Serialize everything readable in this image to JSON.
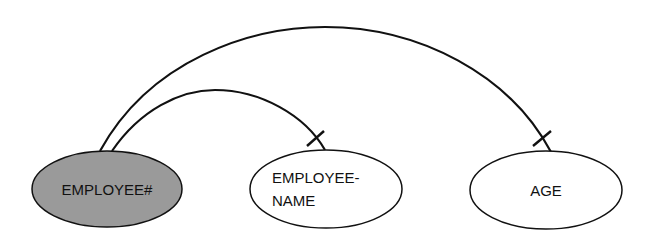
{
  "diagram": {
    "type": "functional-dependency",
    "colors": {
      "key_fill": "#9a9a9a",
      "attr_fill": "#ffffff",
      "stroke": "#111111"
    },
    "nodes": [
      {
        "id": "employee_num",
        "lines": [
          "EMPLOYEE#"
        ],
        "role": "key"
      },
      {
        "id": "employee_name",
        "lines": [
          "EMPLOYEE-",
          "NAME"
        ],
        "role": "attribute"
      },
      {
        "id": "age",
        "lines": [
          "AGE"
        ],
        "role": "attribute"
      }
    ],
    "edges": [
      {
        "from": "employee_num",
        "to": "employee_name",
        "marker": "single-bar"
      },
      {
        "from": "employee_num",
        "to": "age",
        "marker": "single-bar"
      }
    ]
  }
}
